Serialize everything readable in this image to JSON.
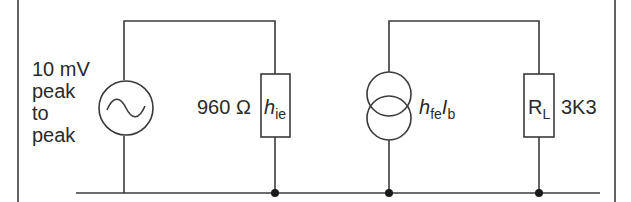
{
  "diagram": {
    "type": "small-signal equivalent circuit",
    "source": {
      "label_lines": [
        "10 mV",
        "peak",
        "to",
        "peak"
      ],
      "symbol": "ac-voltage-source-icon"
    },
    "input_resistance": {
      "value": "960 Ω",
      "symbol_main": "h",
      "symbol_sub": "ie"
    },
    "current_source": {
      "symbol_main": "h",
      "symbol_sub": "fe",
      "current_main": "I",
      "current_sub": "b"
    },
    "load": {
      "symbol_main": "R",
      "symbol_sub": "L",
      "value": "3K3"
    }
  },
  "colors": {
    "line": "#3a3a3a",
    "text": "#2a2a2a",
    "background": "#ffffff"
  }
}
